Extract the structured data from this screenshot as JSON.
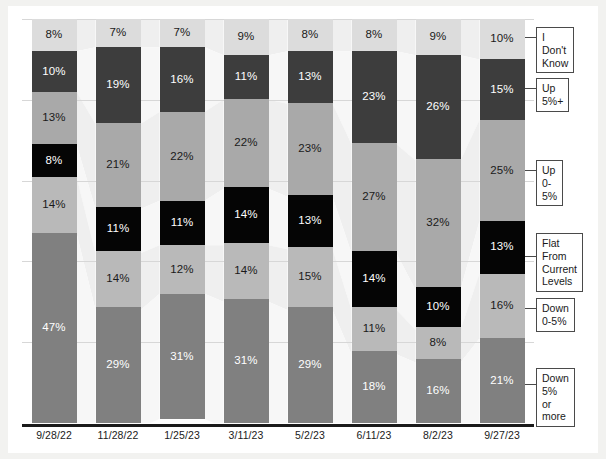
{
  "chart_data": {
    "type": "bar",
    "subtype": "stacked-100-percent",
    "title": "",
    "subtitle": "",
    "xlabel": "",
    "ylabel": "",
    "ylim": [
      0,
      100
    ],
    "grid": true,
    "legend_position": "right",
    "categories": [
      "9/28/22",
      "11/28/22",
      "1/25/23",
      "3/11/23",
      "5/2/23",
      "6/11/23",
      "8/2/23",
      "9/27/23"
    ],
    "series": [
      {
        "name": "I Don't Know",
        "color": "#dcdcdc",
        "text_color": "#1a1a1a",
        "values": [
          8,
          7,
          7,
          9,
          8,
          8,
          9,
          10
        ],
        "labels": [
          "8%",
          "7%",
          "7%",
          "9%",
          "8%",
          "8%",
          "9%",
          "10%"
        ]
      },
      {
        "name": "Up 5%+",
        "color": "#3d3d3d",
        "text_color": "#ffffff",
        "values": [
          10,
          19,
          16,
          11,
          13,
          23,
          26,
          15
        ],
        "labels": [
          "10%",
          "19%",
          "16%",
          "11%",
          "13%",
          "23%",
          "26%",
          "15%"
        ]
      },
      {
        "name": "Up 0-5%",
        "color": "#a9a9a9",
        "text_color": "#1a1a1a",
        "values": [
          13,
          21,
          22,
          22,
          23,
          27,
          32,
          25
        ],
        "labels": [
          "13%",
          "21%",
          "22%",
          "22%",
          "23%",
          "27%",
          "32%",
          "25%"
        ]
      },
      {
        "name": "Flat From Current Levels",
        "color": "#050505",
        "text_color": "#ffffff",
        "values": [
          8,
          11,
          11,
          14,
          13,
          14,
          10,
          13
        ],
        "labels": [
          "8%",
          "11%",
          "11%",
          "14%",
          "13%",
          "14%",
          "10%",
          "13%"
        ]
      },
      {
        "name": "Down 0-5%",
        "color": "#b9b9b9",
        "text_color": "#1a1a1a",
        "values": [
          14,
          14,
          12,
          14,
          15,
          11,
          8,
          16
        ],
        "labels": [
          "14%",
          "14%",
          "12%",
          "14%",
          "15%",
          "11%",
          "8%",
          "16%"
        ]
      },
      {
        "name": "Down 5% or more",
        "color": "#808080",
        "text_color": "#ffffff",
        "values": [
          47,
          29,
          31,
          31,
          29,
          18,
          16,
          21
        ],
        "labels": [
          "47%",
          "29%",
          "31%",
          "31%",
          "29%",
          "18%",
          "16%",
          "21%"
        ]
      }
    ],
    "gridline_values": [
      20,
      40,
      60,
      80,
      100
    ]
  },
  "legend": {
    "items": [
      {
        "label": "I Don't Know",
        "series_index": 0
      },
      {
        "label": "Up 5%+",
        "series_index": 1
      },
      {
        "label": "Up 0-5%",
        "series_index": 2
      },
      {
        "label": "Flat From\nCurrent\nLevels",
        "series_index": 3
      },
      {
        "label": "Down 0-5%",
        "series_index": 4
      },
      {
        "label": "Down 5%\nor more",
        "series_index": 5
      }
    ]
  },
  "axis": {
    "tick_labels": [
      "9/28/22",
      "11/28/22",
      "1/25/23",
      "3/11/23",
      "5/2/23",
      "6/11/23",
      "8/2/23",
      "9/27/23"
    ]
  },
  "colors": {
    "background": "#f2f2f0",
    "panel": "#ffffff",
    "axis": "#1a1a1a",
    "gridline": "#d7d7d7",
    "ribbon": "#ededed"
  }
}
